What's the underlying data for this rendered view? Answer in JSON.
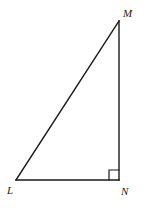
{
  "figure": {
    "name": "right-triangle-LMN",
    "type": "geometry-diagram",
    "background_color": "#ffffff",
    "stroke_color": "#1a1a1a",
    "stroke_width": 1.4,
    "canvas": {
      "width": 145,
      "height": 208
    },
    "vertices": [
      {
        "id": "L",
        "label": "L",
        "x": 16,
        "y": 180,
        "angle_marker": "none"
      },
      {
        "id": "M",
        "label": "M",
        "x": 119,
        "y": 21,
        "angle_marker": "none"
      },
      {
        "id": "N",
        "label": "N",
        "x": 119,
        "y": 180,
        "angle_marker": "right-angle"
      }
    ],
    "edges": [
      {
        "id": "LM",
        "from": "L",
        "to": "M",
        "role": "hypotenuse"
      },
      {
        "id": "MN",
        "from": "M",
        "to": "N",
        "role": "leg-vertical"
      },
      {
        "id": "NL",
        "from": "N",
        "to": "L",
        "role": "leg-horizontal"
      }
    ],
    "right_angle_marker": {
      "at_vertex": "N",
      "size": 10,
      "x": 109,
      "y": 170
    },
    "labels": {
      "M": "M",
      "L": "L",
      "N": "N"
    }
  }
}
